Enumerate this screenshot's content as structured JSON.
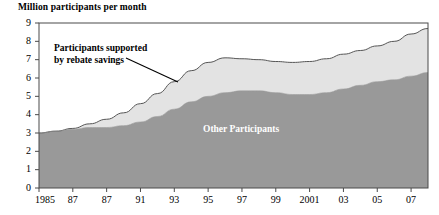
{
  "chart_data": {
    "type": "area",
    "stacked": true,
    "title": "Million participants per month",
    "xlabel": "",
    "ylabel": "",
    "ylim": [
      0,
      9
    ],
    "yticks": [
      0,
      1,
      2,
      3,
      4,
      5,
      6,
      7,
      8,
      9
    ],
    "ytick_labels": [
      "0",
      "1",
      "2",
      "3",
      "4",
      "5",
      "6",
      "7",
      "8",
      "9"
    ],
    "grid": false,
    "legend_position": "in-plot-annotations",
    "x": [
      1985,
      1986,
      1987,
      1988,
      1989,
      1990,
      1991,
      1992,
      1993,
      1994,
      1995,
      1996,
      1997,
      1998,
      1999,
      2000,
      2001,
      2002,
      2003,
      2004,
      2005,
      2006,
      2007,
      2008
    ],
    "xtick_values": [
      1985,
      1987,
      1989,
      1991,
      1993,
      1995,
      1997,
      1999,
      2001,
      2003,
      2005,
      2007
    ],
    "xtick_labels": [
      "1985",
      "87",
      "87",
      "91",
      "93",
      "95",
      "97",
      "99",
      "2001",
      "03",
      "05",
      "07"
    ],
    "series": [
      {
        "name": "Other Participants",
        "color": "#999999",
        "values": [
          3.0,
          3.1,
          3.2,
          3.3,
          3.3,
          3.4,
          3.6,
          3.9,
          4.3,
          4.7,
          5.0,
          5.2,
          5.3,
          5.3,
          5.2,
          5.1,
          5.1,
          5.2,
          5.4,
          5.6,
          5.8,
          5.9,
          6.1,
          6.3
        ]
      },
      {
        "name": "Participants supported by rebate savings",
        "color": "#e3e3e3",
        "values": [
          0.0,
          0.0,
          0.05,
          0.2,
          0.45,
          0.7,
          1.0,
          1.25,
          1.5,
          1.7,
          1.85,
          1.9,
          1.75,
          1.7,
          1.7,
          1.75,
          1.8,
          1.85,
          1.9,
          1.9,
          1.95,
          2.1,
          2.3,
          2.4
        ]
      }
    ],
    "totals": [
      3.0,
      3.1,
      3.25,
      3.5,
      3.75,
      4.1,
      4.6,
      5.15,
      5.8,
      6.4,
      6.85,
      7.1,
      7.05,
      7.0,
      6.9,
      6.85,
      6.9,
      7.05,
      7.3,
      7.5,
      7.75,
      8.0,
      8.4,
      8.7
    ],
    "annotations": [
      {
        "name": "upper-band-label",
        "text": "Participants supported\nby rebate savings",
        "leader_line": true
      },
      {
        "name": "lower-band-label",
        "text": "Other Participants",
        "leader_line": false
      }
    ],
    "colors": {
      "lower_band": "#999999",
      "upper_band": "#e3e3e3",
      "axis": "#4a4a4a",
      "outline": "#555555",
      "background": "#ffffff",
      "lower_label_text": "#ffffff"
    }
  }
}
